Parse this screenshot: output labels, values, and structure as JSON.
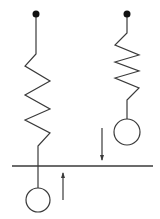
{
  "diagram": {
    "colors": {
      "stroke": "#3a3a3a",
      "fill_dot": "#111111",
      "background": "#ffffff"
    },
    "left_system": {
      "anchor": {
        "cx": 36,
        "cy": 14,
        "r": 3.5
      },
      "spring_points": "36,14 36,54 25,66 50,81 25,95 50,109 25,120 50,133 38,146 38,188",
      "mass": {
        "cx": 38,
        "cy": 200,
        "r": 12
      }
    },
    "right_system": {
      "anchor": {
        "cx": 127,
        "cy": 14,
        "r": 3.5
      },
      "spring_points": "127,14 127,33 115,45 139,55 115,62 139,71 115,78 139,88 127,100 127,119",
      "mass": {
        "cx": 127,
        "cy": 132,
        "r": 13
      }
    },
    "reference_line": {
      "x1": 12,
      "y1": 166,
      "x2": 153,
      "y2": 166
    },
    "arrows": [
      {
        "name": "down-arrow",
        "x": 102,
        "from_y": 128,
        "to_y": 160
      },
      {
        "name": "up-arrow",
        "x": 63,
        "from_y": 200,
        "to_y": 173
      }
    ]
  }
}
